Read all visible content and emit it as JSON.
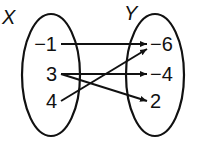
{
  "domain_labels": {
    "x_set": "X",
    "y_set": "Y"
  },
  "x_values": [
    "−1",
    "3",
    "4"
  ],
  "y_values": [
    "−6",
    "−4",
    "2"
  ],
  "mappings": [
    {
      "from": 0,
      "to": 0
    },
    {
      "from": 1,
      "to": 1
    },
    {
      "from": 1,
      "to": 2
    },
    {
      "from": 2,
      "to": 0
    }
  ],
  "colors": {
    "stroke": "#111111",
    "background": "#ffffff"
  }
}
